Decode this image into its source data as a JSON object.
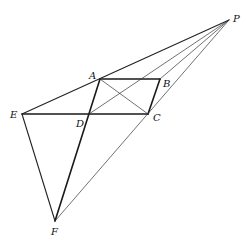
{
  "diagram": {
    "type": "geometry-construction",
    "points": {
      "P": {
        "label": "P",
        "x": 229,
        "y": 20,
        "lx": 233,
        "ly": 22
      },
      "A": {
        "label": "A",
        "x": 100,
        "y": 79,
        "lx": 89,
        "ly": 79
      },
      "B": {
        "label": "B",
        "x": 160,
        "y": 79,
        "lx": 163,
        "ly": 87
      },
      "C": {
        "label": "C",
        "x": 148,
        "y": 114,
        "lx": 153,
        "ly": 121
      },
      "D": {
        "label": "D",
        "x": 89,
        "y": 114,
        "lx": 76,
        "ly": 127
      },
      "E": {
        "label": "E",
        "x": 22,
        "y": 114,
        "lx": 10,
        "ly": 118
      },
      "F": {
        "label": "F",
        "x": 55,
        "y": 221,
        "lx": 51,
        "ly": 235
      }
    },
    "segments": [
      {
        "name": "AB",
        "from": "A",
        "to": "B",
        "weight": "thick"
      },
      {
        "name": "BC",
        "from": "B",
        "to": "C",
        "weight": "thick"
      },
      {
        "name": "EC",
        "from": "E",
        "to": "C",
        "weight": "thick"
      },
      {
        "name": "AF",
        "from": "A",
        "to": "F",
        "weight": "thick"
      },
      {
        "name": "EP",
        "from": "E",
        "to": "P",
        "weight": "med"
      },
      {
        "name": "FP",
        "from": "F",
        "to": "P",
        "weight": "thin"
      },
      {
        "name": "EF",
        "from": "E",
        "to": "F",
        "weight": "med"
      },
      {
        "name": "AC",
        "from": "A",
        "to": "C",
        "weight": "thin"
      },
      {
        "name": "DP",
        "from": "D",
        "to": "P",
        "weight": "thin"
      },
      {
        "name": "BP",
        "from": "B",
        "to": "P",
        "weight": "thin"
      }
    ]
  }
}
